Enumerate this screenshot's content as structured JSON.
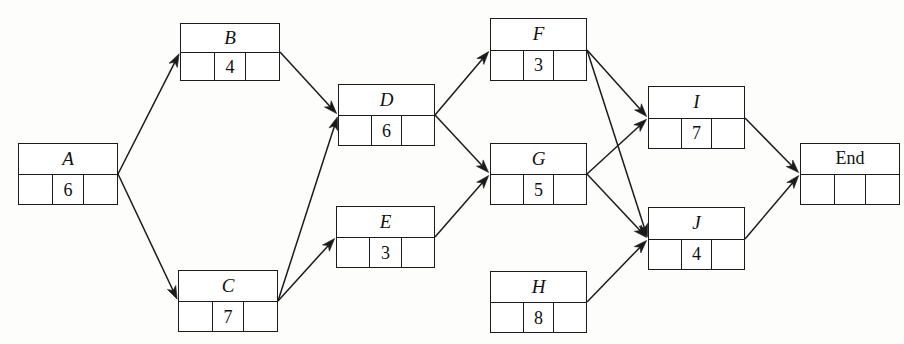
{
  "diagram": {
    "type": "activity-on-node-network",
    "stroke_color": "#1b1b1b",
    "background_color": "#fdfdfc",
    "node_cell_count": 3,
    "nodes": [
      {
        "id": "A",
        "label": "A",
        "duration": "6",
        "italic": true,
        "x": 18,
        "y": 143,
        "w": 100,
        "h": 62
      },
      {
        "id": "B",
        "label": "B",
        "duration": "4",
        "italic": true,
        "x": 180,
        "y": 23,
        "w": 100,
        "h": 58
      },
      {
        "id": "C",
        "label": "C",
        "duration": "7",
        "italic": true,
        "x": 178,
        "y": 270,
        "w": 100,
        "h": 62
      },
      {
        "id": "D",
        "label": "D",
        "duration": "6",
        "italic": true,
        "x": 338,
        "y": 84,
        "w": 97,
        "h": 62
      },
      {
        "id": "E",
        "label": "E",
        "duration": "3",
        "italic": true,
        "x": 336,
        "y": 206,
        "w": 99,
        "h": 62
      },
      {
        "id": "F",
        "label": "F",
        "duration": "3",
        "italic": true,
        "x": 490,
        "y": 18,
        "w": 97,
        "h": 63
      },
      {
        "id": "G",
        "label": "G",
        "duration": "5",
        "italic": true,
        "x": 490,
        "y": 143,
        "w": 97,
        "h": 62
      },
      {
        "id": "H",
        "label": "H",
        "duration": "8",
        "italic": true,
        "x": 490,
        "y": 271,
        "w": 97,
        "h": 62
      },
      {
        "id": "I",
        "label": "I",
        "duration": "7",
        "italic": true,
        "x": 648,
        "y": 86,
        "w": 97,
        "h": 63
      },
      {
        "id": "J",
        "label": "J",
        "duration": "4",
        "italic": true,
        "x": 648,
        "y": 207,
        "w": 97,
        "h": 63
      },
      {
        "id": "End",
        "label": "End",
        "duration": "",
        "italic": false,
        "x": 800,
        "y": 143,
        "w": 100,
        "h": 62
      }
    ],
    "edges": [
      {
        "id": "A-B",
        "from": "A",
        "to": "B",
        "x1": 118,
        "y1": 174,
        "x2": 180,
        "y2": 52
      },
      {
        "id": "A-C",
        "from": "A",
        "to": "C",
        "x1": 118,
        "y1": 174,
        "x2": 178,
        "y2": 301
      },
      {
        "id": "B-D",
        "from": "B",
        "to": "D",
        "x1": 280,
        "y1": 52,
        "x2": 338,
        "y2": 115
      },
      {
        "id": "C-D",
        "from": "C",
        "to": "D",
        "x1": 278,
        "y1": 301,
        "x2": 338,
        "y2": 115
      },
      {
        "id": "C-E",
        "from": "C",
        "to": "E",
        "x1": 278,
        "y1": 301,
        "x2": 336,
        "y2": 237
      },
      {
        "id": "D-F",
        "from": "D",
        "to": "F",
        "x1": 435,
        "y1": 115,
        "x2": 490,
        "y2": 50
      },
      {
        "id": "D-G",
        "from": "D",
        "to": "G",
        "x1": 435,
        "y1": 115,
        "x2": 490,
        "y2": 174
      },
      {
        "id": "E-G",
        "from": "E",
        "to": "G",
        "x1": 435,
        "y1": 237,
        "x2": 490,
        "y2": 174
      },
      {
        "id": "F-I",
        "from": "F",
        "to": "I",
        "x1": 587,
        "y1": 50,
        "x2": 648,
        "y2": 118
      },
      {
        "id": "F-J",
        "from": "F",
        "to": "J",
        "x1": 587,
        "y1": 50,
        "x2": 648,
        "y2": 239
      },
      {
        "id": "G-I",
        "from": "G",
        "to": "I",
        "x1": 587,
        "y1": 174,
        "x2": 648,
        "y2": 118
      },
      {
        "id": "G-J",
        "from": "G",
        "to": "J",
        "x1": 587,
        "y1": 174,
        "x2": 648,
        "y2": 239
      },
      {
        "id": "H-J",
        "from": "H",
        "to": "J",
        "x1": 587,
        "y1": 302,
        "x2": 648,
        "y2": 239
      },
      {
        "id": "I-End",
        "from": "I",
        "to": "End",
        "x1": 745,
        "y1": 118,
        "x2": 800,
        "y2": 174
      },
      {
        "id": "J-End",
        "from": "J",
        "to": "End",
        "x1": 745,
        "y1": 239,
        "x2": 800,
        "y2": 174
      }
    ]
  }
}
